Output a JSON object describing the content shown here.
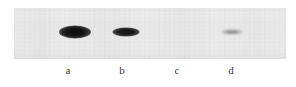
{
  "figure": {
    "type": "western-blot",
    "caption": "",
    "background_color": "#ffffff",
    "membrane": {
      "color": "#eaeaeb",
      "x": 14,
      "y": 8,
      "width": 272,
      "height": 51
    }
  },
  "lanes": [
    {
      "label": "a",
      "label_x": 68,
      "band": {
        "present": true,
        "intensity": "strong",
        "intensity_value": 100,
        "center_x": 75,
        "center_y": 32,
        "width": 32,
        "height": 13,
        "color": "#101010"
      }
    },
    {
      "label": "b",
      "label_x": 122,
      "band": {
        "present": true,
        "intensity": "medium",
        "intensity_value": 72,
        "center_x": 126,
        "center_y": 32,
        "width": 27,
        "height": 9,
        "color": "#171717"
      }
    },
    {
      "label": "c",
      "label_x": 177,
      "band": {
        "present": false,
        "intensity": "none",
        "intensity_value": 0,
        "center_x": 178,
        "center_y": 32,
        "width": 0,
        "height": 0,
        "color": "#eaeaeb"
      }
    },
    {
      "label": "d",
      "label_x": 231,
      "band": {
        "present": true,
        "intensity": "faint",
        "intensity_value": 18,
        "center_x": 232,
        "center_y": 32,
        "width": 22,
        "height": 5,
        "color": "#6e6e70"
      }
    }
  ],
  "chart_data": {
    "type": "bar",
    "title": "",
    "xlabel": "",
    "ylabel": "Band intensity (relative)",
    "categories": [
      "a",
      "b",
      "c",
      "d"
    ],
    "values": [
      100,
      72,
      0,
      18
    ],
    "ylim": [
      0,
      100
    ],
    "grid": false,
    "legend": null
  }
}
